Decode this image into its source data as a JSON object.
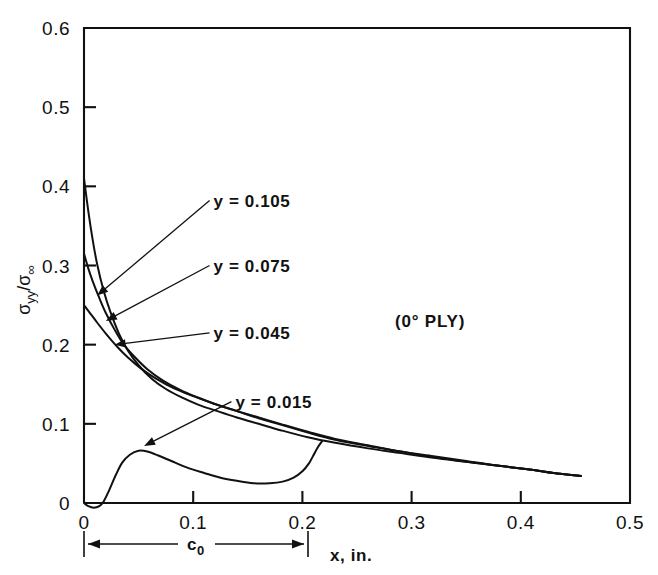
{
  "figure": {
    "background": "#ffffff",
    "ink": "#111111"
  },
  "annotations": {
    "ply": "(0° PLY)",
    "bracket_label_main": "c",
    "bracket_label_sub": "0"
  },
  "axis_titles": {
    "x": "x, in.",
    "y_num": "σ",
    "y_num_sub": "yy",
    "y_den": "σ",
    "y_den_sub": "∞",
    "y_slash": "/"
  },
  "chart_data": {
    "type": "line",
    "title": "",
    "subtitle": "",
    "xlabel": "x, in.",
    "ylabel": "σyy/σ∞",
    "xlim": [
      0,
      0.5
    ],
    "ylim": [
      0,
      0.6
    ],
    "grid": false,
    "legend": "inline-annotations",
    "xticks": [
      0,
      0.1,
      0.2,
      0.3,
      0.4,
      0.5
    ],
    "xticklabels": [
      "0",
      "0.1",
      "0.2",
      "0.3",
      "0.4",
      "0.5"
    ],
    "yticks": [
      0,
      0.1,
      0.2,
      0.3,
      0.4,
      0.5,
      0.6
    ],
    "yticklabels": [
      "0",
      "0.1",
      "0.2",
      "0.3",
      "0.4",
      "0.5",
      "0.6"
    ],
    "annotations": [
      {
        "text": "(0° PLY)",
        "x": 0.285,
        "y": 0.225
      },
      {
        "text": "c₀",
        "x": 0.1,
        "y": -0.075,
        "kind": "span-bracket",
        "from_x": 0.0,
        "to_x": 0.205
      }
    ],
    "series": [
      {
        "name": "y = 0.105",
        "label": "y = 0.105",
        "label_x": 0.115,
        "label_y": 0.382,
        "arrow_to_x": 0.012,
        "arrow_to_y": 0.262,
        "points": [
          [
            0.0,
            0.41
          ],
          [
            0.004,
            0.368
          ],
          [
            0.008,
            0.332
          ],
          [
            0.012,
            0.302
          ],
          [
            0.018,
            0.268
          ],
          [
            0.024,
            0.242
          ],
          [
            0.032,
            0.214
          ],
          [
            0.04,
            0.193
          ],
          [
            0.05,
            0.174
          ],
          [
            0.062,
            0.157
          ],
          [
            0.075,
            0.144
          ],
          [
            0.09,
            0.133
          ],
          [
            0.105,
            0.124
          ],
          [
            0.12,
            0.117
          ],
          [
            0.14,
            0.108
          ],
          [
            0.16,
            0.1
          ],
          [
            0.18,
            0.092
          ],
          [
            0.205,
            0.083
          ],
          [
            0.23,
            0.076
          ],
          [
            0.26,
            0.069
          ],
          [
            0.29,
            0.063
          ],
          [
            0.32,
            0.057
          ],
          [
            0.35,
            0.052
          ],
          [
            0.38,
            0.047
          ],
          [
            0.41,
            0.042
          ],
          [
            0.43,
            0.038
          ],
          [
            0.455,
            0.034
          ]
        ]
      },
      {
        "name": "y = 0.075",
        "label": "y = 0.075",
        "label_x": 0.115,
        "label_y": 0.3,
        "arrow_to_x": 0.02,
        "arrow_to_y": 0.23,
        "points": [
          [
            0.0,
            0.315
          ],
          [
            0.004,
            0.296
          ],
          [
            0.008,
            0.28
          ],
          [
            0.014,
            0.259
          ],
          [
            0.02,
            0.24
          ],
          [
            0.028,
            0.219
          ],
          [
            0.036,
            0.201
          ],
          [
            0.046,
            0.185
          ],
          [
            0.058,
            0.169
          ],
          [
            0.072,
            0.155
          ],
          [
            0.088,
            0.143
          ],
          [
            0.105,
            0.133
          ],
          [
            0.122,
            0.124
          ],
          [
            0.14,
            0.116
          ],
          [
            0.16,
            0.107
          ],
          [
            0.18,
            0.099
          ],
          [
            0.205,
            0.089
          ],
          [
            0.23,
            0.08
          ],
          [
            0.26,
            0.072
          ],
          [
            0.29,
            0.065
          ],
          [
            0.32,
            0.058
          ],
          [
            0.35,
            0.052
          ],
          [
            0.38,
            0.047
          ],
          [
            0.41,
            0.042
          ],
          [
            0.43,
            0.038
          ],
          [
            0.455,
            0.034
          ]
        ]
      },
      {
        "name": "y = 0.045",
        "label": "y = 0.045",
        "label_x": 0.115,
        "label_y": 0.215,
        "arrow_to_x": 0.028,
        "arrow_to_y": 0.2,
        "points": [
          [
            0.0,
            0.25
          ],
          [
            0.006,
            0.239
          ],
          [
            0.012,
            0.228
          ],
          [
            0.02,
            0.214
          ],
          [
            0.03,
            0.198
          ],
          [
            0.04,
            0.184
          ],
          [
            0.052,
            0.17
          ],
          [
            0.066,
            0.157
          ],
          [
            0.082,
            0.145
          ],
          [
            0.1,
            0.135
          ],
          [
            0.118,
            0.126
          ],
          [
            0.138,
            0.117
          ],
          [
            0.16,
            0.108
          ],
          [
            0.182,
            0.099
          ],
          [
            0.205,
            0.09
          ],
          [
            0.23,
            0.081
          ],
          [
            0.26,
            0.073
          ],
          [
            0.29,
            0.065
          ],
          [
            0.32,
            0.059
          ],
          [
            0.35,
            0.053
          ],
          [
            0.38,
            0.047
          ],
          [
            0.41,
            0.042
          ],
          [
            0.43,
            0.038
          ],
          [
            0.455,
            0.034
          ]
        ]
      },
      {
        "name": "y = 0.015",
        "label": "y = 0.015",
        "label_x": 0.135,
        "label_y": 0.128,
        "arrow_to_x": 0.055,
        "arrow_to_y": 0.072,
        "points": [
          [
            0.0,
            0.0
          ],
          [
            0.004,
            -0.004
          ],
          [
            0.009,
            -0.006
          ],
          [
            0.014,
            -0.004
          ],
          [
            0.018,
            0.002
          ],
          [
            0.023,
            0.016
          ],
          [
            0.029,
            0.035
          ],
          [
            0.035,
            0.051
          ],
          [
            0.042,
            0.061
          ],
          [
            0.05,
            0.066
          ],
          [
            0.058,
            0.065
          ],
          [
            0.068,
            0.06
          ],
          [
            0.08,
            0.053
          ],
          [
            0.094,
            0.045
          ],
          [
            0.11,
            0.038
          ],
          [
            0.125,
            0.032
          ],
          [
            0.14,
            0.028
          ],
          [
            0.155,
            0.025
          ],
          [
            0.17,
            0.025
          ],
          [
            0.182,
            0.027
          ],
          [
            0.192,
            0.032
          ],
          [
            0.2,
            0.04
          ],
          [
            0.206,
            0.05
          ],
          [
            0.21,
            0.06
          ],
          [
            0.214,
            0.07
          ],
          [
            0.218,
            0.078
          ]
        ]
      }
    ]
  }
}
